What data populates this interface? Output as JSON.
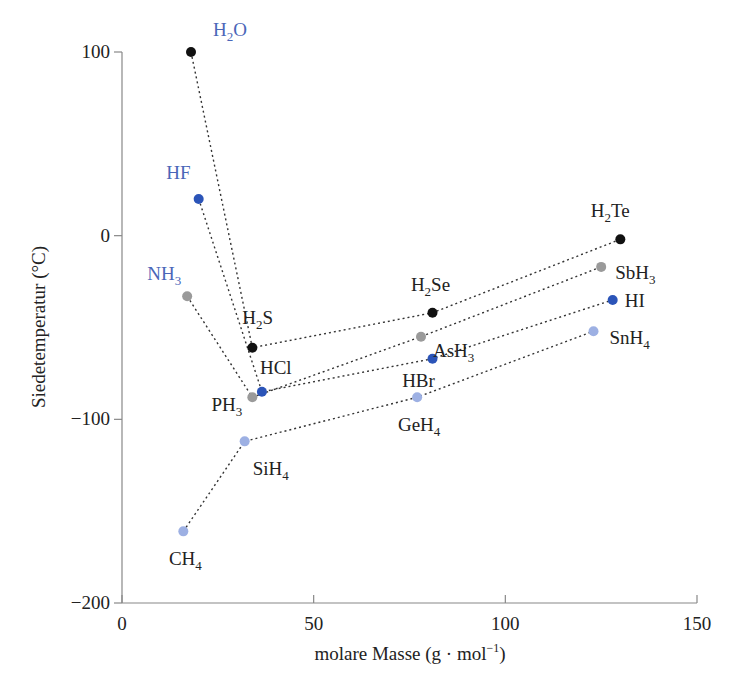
{
  "chart_data": {
    "type": "scatter",
    "title": "",
    "xlabel": "molare Masse (g · mol⁻¹)",
    "ylabel": "Siedetemperatur (°C)",
    "xlim": [
      0,
      150
    ],
    "ylim": [
      -200,
      100
    ],
    "xticks": [
      0,
      50,
      100,
      150
    ],
    "yticks": [
      100,
      0,
      -100,
      -200
    ],
    "grid": false,
    "legend": "none (points labeled directly)",
    "colors": {
      "group16": "#111111",
      "group17": "#2b54b8",
      "group15": "#9a9a9a",
      "group14": "#9db0e3",
      "label_highlight": "#4a66b8",
      "label_default": "#222222"
    },
    "series": [
      {
        "name": "Gruppe 16 (H2X)",
        "color": "#111111",
        "points": [
          {
            "label": "H2O",
            "sub": "2",
            "x": 18,
            "y": 100,
            "highlight": true
          },
          {
            "label": "H2S",
            "sub": "2",
            "x": 34,
            "y": -61
          },
          {
            "label": "H2Se",
            "sub": "2",
            "x": 81,
            "y": -42
          },
          {
            "label": "H2Te",
            "sub": "2",
            "x": 130,
            "y": -2
          }
        ]
      },
      {
        "name": "Gruppe 17 (HX)",
        "color": "#2b54b8",
        "points": [
          {
            "label": "HF",
            "x": 20,
            "y": 20,
            "highlight": true
          },
          {
            "label": "HCl",
            "x": 36.5,
            "y": -85
          },
          {
            "label": "HBr",
            "x": 81,
            "y": -67
          },
          {
            "label": "HI",
            "x": 128,
            "y": -35
          }
        ]
      },
      {
        "name": "Gruppe 15 (XH3)",
        "color": "#9a9a9a",
        "points": [
          {
            "label": "NH3",
            "x": 17,
            "y": -33,
            "highlight": true
          },
          {
            "label": "PH3",
            "x": 34,
            "y": -88
          },
          {
            "label": "AsH3",
            "x": 78,
            "y": -55
          },
          {
            "label": "SbH3",
            "x": 125,
            "y": -17
          }
        ]
      },
      {
        "name": "Gruppe 14 (XH4)",
        "color": "#9db0e3",
        "points": [
          {
            "label": "CH4",
            "x": 16,
            "y": -161
          },
          {
            "label": "SiH4",
            "x": 32,
            "y": -112
          },
          {
            "label": "GeH4",
            "x": 77,
            "y": -88
          },
          {
            "label": "SnH4",
            "x": 123,
            "y": -52
          }
        ]
      }
    ]
  },
  "axes": {
    "x_title": "molare Masse (g · mol",
    "x_title_sup": "−1",
    "x_title_end": ")",
    "y_title": "Siedetemperatur (°C)",
    "x_tick_labels": [
      "0",
      "50",
      "100",
      "150"
    ],
    "y_tick_labels": [
      "100",
      "0",
      "−100",
      "−200"
    ]
  }
}
